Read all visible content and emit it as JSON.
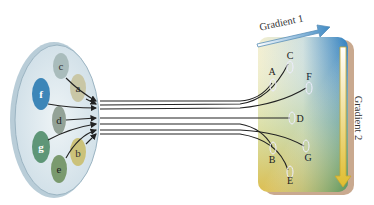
{
  "diagram": {
    "source_spots": [
      {
        "label": "c",
        "color": "#a9bcbc"
      },
      {
        "label": "a",
        "color": "#c9c7a6"
      },
      {
        "label": "f",
        "color": "#3d86b8"
      },
      {
        "label": "d",
        "color": "#93a297"
      },
      {
        "label": "g",
        "color": "#5e9677"
      },
      {
        "label": "b",
        "color": "#cbc27a"
      },
      {
        "label": "e",
        "color": "#7a9a6e"
      }
    ],
    "target_spots": [
      {
        "label": "A"
      },
      {
        "label": "C"
      },
      {
        "label": "F"
      },
      {
        "label": "D"
      },
      {
        "label": "B"
      },
      {
        "label": "G"
      },
      {
        "label": "E"
      }
    ],
    "gradient_1_label": "Gradient 1",
    "gradient_2_label": "Gradient 2",
    "colors": {
      "dish_fill": "#dfe9ee",
      "dish_edge": "#9bb4c2",
      "gel_top_right": "#3a84c0",
      "gel_bottom_left": "#e0c34a",
      "gel_bottom": "#5a9a6a",
      "line": "#222222",
      "arrow1": "#4a93c8",
      "arrow2": "#e2c23a"
    }
  }
}
